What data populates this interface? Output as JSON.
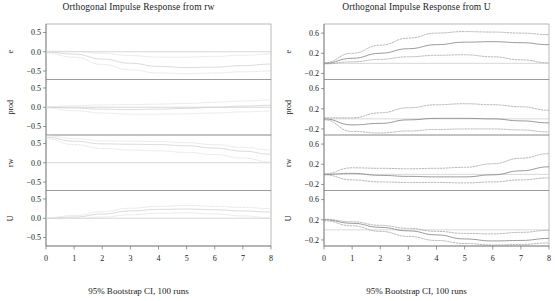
{
  "figures": [
    {
      "id": "rw",
      "title": "Orthogonal Impulse Response from rw",
      "caption": "95% Bootstrap CI, 100 runs",
      "ink": "#cfcfcf",
      "band_ink": "#dcdcdc"
    },
    {
      "id": "U",
      "title": "Orthogonal Impulse Response from U",
      "caption": "95% Bootstrap CI, 100 runs",
      "ink": "#7a7a7a",
      "band_ink": "#9a9a9a"
    }
  ],
  "chart_data": [
    {
      "type": "line",
      "title": "Orthogonal Impulse Response from rw",
      "subtitle": "95% Bootstrap CI, 100 runs",
      "xlabel": "",
      "ylabel": "",
      "x": [
        0,
        1,
        2,
        3,
        4,
        5,
        6,
        7,
        8
      ],
      "xlim": [
        0,
        8
      ],
      "xticks": [
        0,
        1,
        2,
        3,
        4,
        5,
        6,
        7,
        8
      ],
      "grid": false,
      "legend": "none",
      "annotation": "Faint / washed-out rendering; four stacked response panels share the x axis.",
      "panels": [
        {
          "ylabel": "e",
          "ylim": [
            -0.72,
            0.72
          ],
          "yticks": [
            0.5,
            0.0,
            -0.5
          ],
          "series": [
            {
              "name": "fit",
              "style": "solid",
              "values": [
                -0.01,
                -0.06,
                -0.19,
                -0.3,
                -0.38,
                -0.41,
                -0.4,
                -0.36,
                -0.32
              ]
            },
            {
              "name": "upper",
              "style": "dashed",
              "values": [
                0.02,
                0.01,
                -0.04,
                -0.1,
                -0.14,
                -0.14,
                -0.12,
                -0.09,
                -0.06
              ]
            },
            {
              "name": "lower",
              "style": "dashed",
              "values": [
                -0.04,
                -0.14,
                -0.33,
                -0.47,
                -0.55,
                -0.57,
                -0.55,
                -0.52,
                -0.5
              ]
            }
          ]
        },
        {
          "ylabel": "prod",
          "ylim": [
            -0.72,
            0.72
          ],
          "yticks": [
            0.5,
            0.0,
            -0.5
          ],
          "series": [
            {
              "name": "fit",
              "style": "solid",
              "values": [
                0.0,
                -0.02,
                -0.05,
                -0.06,
                -0.05,
                -0.03,
                0.0,
                0.03,
                0.05
              ]
            },
            {
              "name": "upper",
              "style": "dashed",
              "values": [
                0.01,
                0.04,
                0.06,
                0.07,
                0.08,
                0.1,
                0.13,
                0.16,
                0.19
              ]
            },
            {
              "name": "lower",
              "style": "dashed",
              "values": [
                -0.02,
                -0.09,
                -0.15,
                -0.18,
                -0.18,
                -0.17,
                -0.15,
                -0.12,
                -0.1
              ]
            }
          ]
        },
        {
          "ylabel": "rw",
          "ylim": [
            -0.72,
            0.72
          ],
          "yticks": [
            0.5,
            0.0,
            -0.5
          ],
          "series": [
            {
              "name": "fit",
              "style": "solid",
              "values": [
                0.66,
                0.56,
                0.49,
                0.48,
                0.47,
                0.44,
                0.38,
                0.3,
                0.22
              ]
            },
            {
              "name": "upper",
              "style": "dashed",
              "values": [
                0.7,
                0.63,
                0.57,
                0.56,
                0.55,
                0.52,
                0.47,
                0.4,
                0.33
              ]
            },
            {
              "name": "lower",
              "style": "dashed",
              "values": [
                0.62,
                0.47,
                0.37,
                0.33,
                0.31,
                0.27,
                0.21,
                0.12,
                0.02
              ]
            }
          ]
        },
        {
          "ylabel": "U",
          "ylim": [
            -0.72,
            0.72
          ],
          "yticks": [
            0.5,
            0.0,
            -0.5
          ],
          "series": [
            {
              "name": "fit",
              "style": "solid",
              "values": [
                0.0,
                0.03,
                0.11,
                0.19,
                0.23,
                0.24,
                0.22,
                0.19,
                0.16
              ]
            },
            {
              "name": "upper",
              "style": "dashed",
              "values": [
                0.01,
                0.07,
                0.17,
                0.26,
                0.31,
                0.33,
                0.31,
                0.28,
                0.25
              ]
            },
            {
              "name": "lower",
              "style": "dashed",
              "values": [
                -0.01,
                -0.01,
                0.03,
                0.09,
                0.13,
                0.14,
                0.11,
                0.06,
                0.01
              ]
            }
          ]
        }
      ]
    },
    {
      "type": "line",
      "title": "Orthogonal Impulse Response from U",
      "subtitle": "95% Bootstrap CI, 100 runs",
      "xlabel": "",
      "ylabel": "",
      "x": [
        0,
        1,
        2,
        3,
        4,
        5,
        6,
        7,
        8
      ],
      "xlim": [
        0,
        8
      ],
      "xticks": [
        0,
        1,
        2,
        3,
        4,
        5,
        6,
        7,
        8
      ],
      "grid": false,
      "legend": "none",
      "annotation": "Solid line = orthogonal impulse response; dashed lines = 95% bootstrap confidence band.",
      "panels": [
        {
          "ylabel": "e",
          "ylim": [
            -0.32,
            0.78
          ],
          "yticks": [
            0.6,
            0.2,
            -0.2
          ],
          "series": [
            {
              "name": "fit",
              "style": "solid",
              "values": [
                0.0,
                0.1,
                0.2,
                0.29,
                0.37,
                0.42,
                0.43,
                0.41,
                0.37
              ]
            },
            {
              "name": "upper",
              "style": "dashed",
              "values": [
                0.01,
                0.2,
                0.36,
                0.5,
                0.6,
                0.63,
                0.62,
                0.6,
                0.57
              ]
            },
            {
              "name": "lower",
              "style": "dashed",
              "values": [
                -0.01,
                0.03,
                0.08,
                0.13,
                0.16,
                0.17,
                0.13,
                0.07,
                0.01
              ]
            }
          ]
        },
        {
          "ylabel": "prod",
          "ylim": [
            -0.32,
            0.78
          ],
          "yticks": [
            0.6,
            0.2,
            -0.2
          ],
          "series": [
            {
              "name": "fit",
              "style": "solid",
              "values": [
                0.0,
                -0.12,
                -0.09,
                -0.02,
                0.01,
                0.01,
                0.0,
                -0.04,
                -0.08
              ]
            },
            {
              "name": "upper",
              "style": "dashed",
              "values": [
                0.02,
                0.02,
                0.12,
                0.22,
                0.28,
                0.3,
                0.28,
                0.24,
                0.17
              ]
            },
            {
              "name": "lower",
              "style": "dashed",
              "values": [
                -0.02,
                -0.25,
                -0.28,
                -0.24,
                -0.21,
                -0.2,
                -0.2,
                -0.22,
                -0.26
              ]
            }
          ]
        },
        {
          "ylabel": "rw",
          "ylim": [
            -0.32,
            0.78
          ],
          "yticks": [
            0.6,
            0.2,
            -0.2
          ],
          "series": [
            {
              "name": "fit",
              "style": "solid",
              "values": [
                0.0,
                0.02,
                -0.02,
                -0.04,
                -0.05,
                -0.05,
                -0.01,
                0.07,
                0.15
              ]
            },
            {
              "name": "upper",
              "style": "dashed",
              "values": [
                0.01,
                0.13,
                0.12,
                0.11,
                0.12,
                0.14,
                0.21,
                0.32,
                0.41
              ]
            },
            {
              "name": "lower",
              "style": "dashed",
              "values": [
                -0.01,
                -0.11,
                -0.15,
                -0.16,
                -0.16,
                -0.17,
                -0.15,
                -0.11,
                -0.07
              ]
            }
          ]
        },
        {
          "ylabel": "U",
          "ylim": [
            -0.32,
            0.78
          ],
          "yticks": [
            0.6,
            0.2,
            -0.2
          ],
          "series": [
            {
              "name": "fit",
              "style": "solid",
              "values": [
                0.2,
                0.13,
                0.05,
                -0.02,
                -0.1,
                -0.18,
                -0.22,
                -0.21,
                -0.17
              ]
            },
            {
              "name": "upper",
              "style": "dashed",
              "values": [
                0.21,
                0.16,
                0.09,
                0.03,
                -0.03,
                -0.07,
                -0.08,
                -0.05,
                -0.01
              ]
            },
            {
              "name": "lower",
              "style": "dashed",
              "values": [
                0.18,
                0.08,
                -0.03,
                -0.13,
                -0.21,
                -0.27,
                -0.3,
                -0.29,
                -0.26
              ]
            }
          ]
        }
      ]
    }
  ]
}
